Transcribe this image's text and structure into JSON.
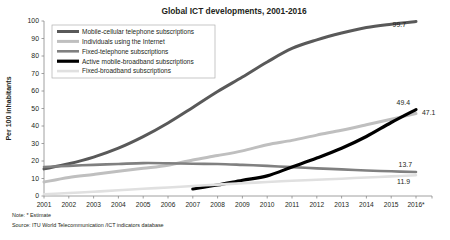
{
  "chart_data": {
    "type": "line",
    "title": "Global ICT developments, 2001-2016",
    "xlabel": "",
    "ylabel": "Per 100 inhabitants",
    "ylim": [
      0,
      100
    ],
    "ytick_step": 10,
    "yticks": [
      "0",
      "10",
      "20",
      "30",
      "40",
      "50",
      "60",
      "70",
      "80",
      "90",
      "100"
    ],
    "grid": false,
    "legend_position": "top-left",
    "categories": [
      "2001",
      "2002",
      "2003",
      "2004",
      "2005",
      "2006",
      "2007",
      "2008",
      "2009",
      "2010",
      "2011",
      "2012",
      "2013",
      "2014",
      "2015",
      "2016*"
    ],
    "series": [
      {
        "name": "Mobile-cellular telephone subscriptions",
        "color": "#595959",
        "width": 3.0,
        "values": [
          15.5,
          18.4,
          22.2,
          27.3,
          33.9,
          41.7,
          50.6,
          59.7,
          68.0,
          76.6,
          84.3,
          89.2,
          93.1,
          96.3,
          98.2,
          99.7
        ],
        "end_label": "99.7"
      },
      {
        "name": "Individuals using the Internet",
        "color": "#bfbfbf",
        "width": 3.0,
        "values": [
          8.0,
          10.6,
          12.3,
          14.1,
          15.8,
          17.6,
          20.6,
          23.1,
          25.8,
          29.3,
          31.8,
          34.8,
          37.6,
          40.7,
          43.9,
          47.1
        ],
        "end_label": "47.1"
      },
      {
        "name": "Fixed-telephone subscriptions",
        "color": "#808080",
        "width": 2.6,
        "values": [
          16.6,
          17.2,
          17.8,
          18.3,
          18.8,
          18.7,
          18.4,
          18.3,
          17.8,
          17.2,
          16.5,
          15.8,
          15.2,
          14.6,
          14.1,
          13.7
        ],
        "end_label": "13.7"
      },
      {
        "name": "Active mobile-broadband subscriptions",
        "color": "#000000",
        "width": 3.2,
        "start_index": 6,
        "values": [
          null,
          null,
          null,
          null,
          null,
          null,
          4.0,
          6.3,
          9.0,
          11.5,
          16.6,
          21.7,
          27.3,
          34.0,
          42.0,
          49.4
        ],
        "end_label": "49.4"
      },
      {
        "name": "Fixed-broadband subscriptions",
        "color": "#e0e0e0",
        "width": 2.6,
        "values": [
          1.0,
          1.7,
          2.4,
          3.3,
          4.1,
          4.9,
          5.7,
          6.5,
          7.3,
          8.0,
          8.7,
          9.3,
          9.9,
          10.6,
          11.2,
          11.9
        ],
        "end_label": "11.9"
      }
    ]
  },
  "notes": {
    "note_line": "Note:  * Estimate",
    "source_line": "Source:  ITU World Telecommunication  /ICT indicators database"
  }
}
